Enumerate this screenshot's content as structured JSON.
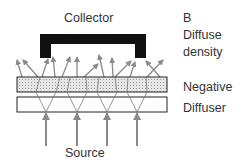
{
  "labels": {
    "collector": "Collector",
    "panel": "B",
    "title_line1": "Diffuse",
    "title_line2": "density",
    "negative": "Negative",
    "diffuser": "Diffuser",
    "source": "Source"
  },
  "colors": {
    "collector": "#111111",
    "arrow": "#8a8a8a",
    "negative_fill": "#d8d8d8",
    "outline": "#222222"
  }
}
